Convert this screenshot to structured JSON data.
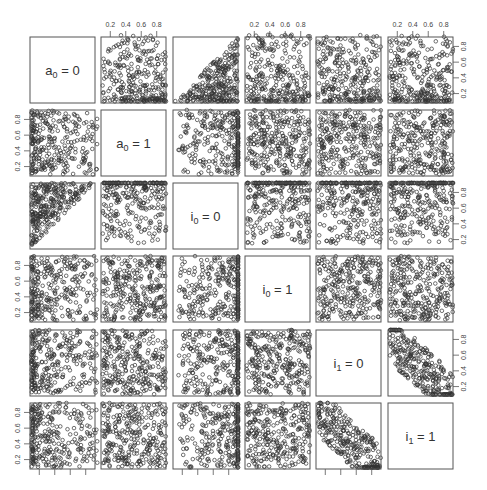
{
  "chart_data": {
    "type": "scatter",
    "title": "",
    "layout": "pairs-matrix",
    "size": 6,
    "variables": [
      {
        "name": "a_0 = 0",
        "base": "a",
        "sub": "0",
        "rhs": "0"
      },
      {
        "name": "a_0 = 1",
        "base": "a",
        "sub": "0",
        "rhs": "1"
      },
      {
        "name": "i_0 = 0",
        "base": "i",
        "sub": "0",
        "rhs": "0"
      },
      {
        "name": "i_0 = 1",
        "base": "i",
        "sub": "0",
        "rhs": "1"
      },
      {
        "name": "i_1 = 0",
        "base": "i",
        "sub": "1",
        "rhs": "0"
      },
      {
        "name": "i_1 = 1",
        "base": "i",
        "sub": "1",
        "rhs": "1"
      }
    ],
    "axis_range": [
      0.08,
      0.92
    ],
    "tick_values": [
      0.2,
      0.4,
      0.6,
      0.8
    ],
    "tick_labels": [
      "0.2",
      "0.4",
      "0.6",
      "0.8"
    ],
    "axes": {
      "top_columns": [
        1,
        3,
        5
      ],
      "bottom_columns": [
        0,
        2,
        4
      ],
      "left_rows": [
        1,
        3,
        5
      ],
      "right_rows": [
        0,
        2,
        4
      ],
      "bottom_labels_visible": false
    },
    "points_per_panel": 300,
    "panel_patterns": {
      "0-1": "low-y",
      "0-2": "y-below-x",
      "0-3": "low-y",
      "0-4": "low-y",
      "0-5": "low-y",
      "1-0": "low-x",
      "1-2": "high-x",
      "1-3": "uniform",
      "1-4": "uniform",
      "1-5": "uniform",
      "2-0": "y-above-x",
      "2-1": "high-y",
      "2-3": "high-y",
      "2-4": "high-y",
      "2-5": "high-y",
      "3-0": "low-x",
      "3-1": "uniform",
      "3-2": "high-x",
      "3-4": "uniform",
      "3-5": "uniform",
      "4-0": "low-x",
      "4-1": "uniform",
      "4-2": "high-x",
      "4-3": "uniform",
      "4-5": "anti-diag",
      "5-0": "low-x",
      "5-1": "uniform",
      "5-2": "high-x",
      "5-3": "uniform",
      "5-4": "anti-diag"
    },
    "grid": false,
    "legend": "none",
    "xlabel": "",
    "ylabel": ""
  },
  "style": {
    "point_color": "#333333",
    "frame_color": "#555555",
    "text_color": "#333333"
  },
  "geometry": {
    "col_x": [
      30,
      101,
      173,
      245,
      316,
      388
    ],
    "row_y": [
      37,
      110,
      183,
      256,
      330,
      403
    ],
    "panel_w": 65,
    "panel_h": 66
  }
}
